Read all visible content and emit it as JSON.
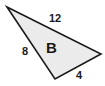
{
  "figure": {
    "type": "geometry-diagram",
    "shape": "triangle",
    "shape_label": "B",
    "background_color": "#ffffff",
    "fill_color": "#ebebeb",
    "stroke_color": "#1a1a1a",
    "text_color": "#1a1a1a",
    "canvas": {
      "width": 105,
      "height": 86
    },
    "vertices": [
      {
        "name": "top-left-apex",
        "x": 7,
        "y": 7
      },
      {
        "name": "right",
        "x": 101,
        "y": 54
      },
      {
        "name": "bottom",
        "x": 55,
        "y": 79
      }
    ],
    "polygon_points": "7,7 101,54 55,79",
    "sides": [
      {
        "name": "top",
        "label": "12",
        "from": "top-left-apex",
        "to": "right"
      },
      {
        "name": "left",
        "label": "8",
        "from": "top-left-apex",
        "to": "bottom"
      },
      {
        "name": "bottom-right",
        "label": "4",
        "from": "bottom",
        "to": "right"
      }
    ]
  }
}
